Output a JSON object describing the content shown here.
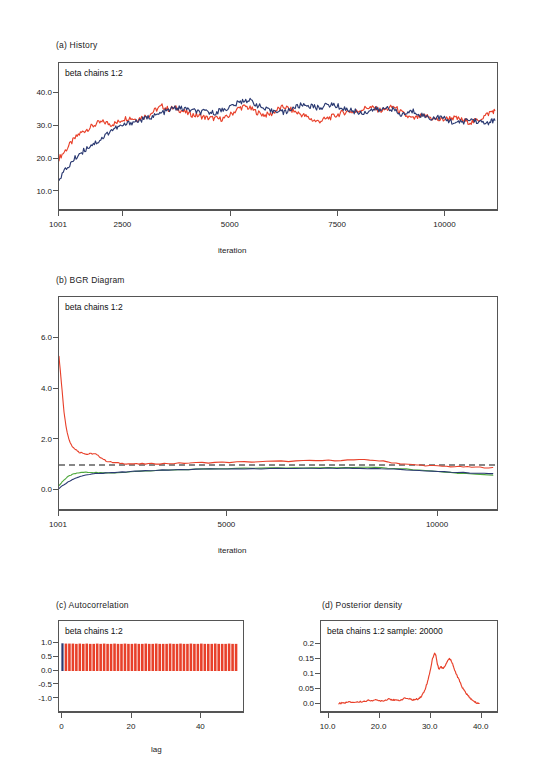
{
  "figure": {
    "panels": [
      {
        "id": "a",
        "title": "(a)  History",
        "legend": "beta chains 1:2",
        "xlabel": "iteration"
      },
      {
        "id": "b",
        "title": "(b)  BGR Diagram",
        "legend": "beta chains 1:2",
        "xlabel": "iteration"
      },
      {
        "id": "c",
        "title": "(c)  Autocorrelation",
        "legend": "beta chains 1:2",
        "xlabel": "lag"
      },
      {
        "id": "d",
        "title": "(d)  Posterior density",
        "legend": "beta chains 1:2 sample: 20000",
        "xlabel": ""
      }
    ]
  },
  "colors": {
    "chain1": "#E8402A",
    "chain2": "#2B3A72",
    "green": "#4FA83D",
    "dashed": "#111111",
    "axis": "#555555"
  },
  "chart_data": [
    {
      "type": "line",
      "panel": "a",
      "title": "(a)  History",
      "legend_text": "beta chains 1:2",
      "xlabel": "iteration",
      "ylabel": "",
      "xticks": [
        "1001",
        "2500",
        "5000",
        "7500",
        "10000"
      ],
      "xtick_values": [
        1001,
        2500,
        5000,
        7500,
        10000
      ],
      "yticks": [
        "10.0",
        "20.0",
        "30.0",
        "40.0"
      ],
      "ytick_values": [
        10,
        20,
        30,
        40
      ],
      "xlim": [
        1001,
        11200
      ],
      "ylim": [
        6,
        45
      ],
      "grid": false,
      "series": [
        {
          "name": "chain 1",
          "color": "#E8402A",
          "x": [
            1001,
            1150,
            1300,
            1450,
            1600,
            1750,
            1900,
            2050,
            2200,
            2350,
            2500,
            2650,
            2800,
            2950,
            3100,
            3250,
            3400,
            3550,
            3700,
            3850,
            4000,
            4150,
            4300,
            4450,
            4600,
            4750,
            4900,
            5050,
            5200,
            5350,
            5500,
            5650,
            5800,
            5950,
            6100,
            6250,
            6400,
            6550,
            6700,
            6850,
            7000,
            7150,
            7300,
            7450,
            7600,
            7750,
            7900,
            8050,
            8200,
            8350,
            8500,
            8650,
            8800,
            8950,
            9100,
            9250,
            9400,
            9550,
            9700,
            9850,
            10000,
            10150,
            10300,
            10450,
            10600,
            10750,
            10900,
            11050,
            11150
          ],
          "values": [
            20.3,
            22.6,
            25.2,
            27.4,
            28.7,
            29.8,
            30.9,
            31.3,
            30.6,
            31.0,
            32.3,
            32.6,
            32.1,
            32.8,
            33.4,
            35.0,
            36.1,
            35.2,
            35.6,
            34.8,
            33.9,
            33.4,
            33.1,
            32.5,
            32.4,
            32.2,
            32.6,
            34.1,
            35.6,
            36.0,
            35.1,
            34.0,
            33.4,
            33.8,
            35.2,
            35.9,
            35.0,
            34.1,
            33.3,
            32.3,
            31.4,
            31.9,
            32.6,
            33.3,
            34.1,
            34.6,
            34.3,
            35.1,
            35.8,
            35.4,
            34.8,
            35.3,
            36.0,
            34.4,
            33.0,
            32.2,
            32.9,
            33.1,
            32.4,
            31.9,
            32.2,
            32.6,
            32.2,
            31.6,
            31.2,
            31.8,
            33.0,
            34.3,
            34.8
          ]
        },
        {
          "name": "chain 2",
          "color": "#2B3A72",
          "x": [
            1001,
            1150,
            1300,
            1450,
            1600,
            1750,
            1900,
            2050,
            2200,
            2350,
            2500,
            2650,
            2800,
            2950,
            3100,
            3250,
            3400,
            3550,
            3700,
            3850,
            4000,
            4150,
            4300,
            4450,
            4600,
            4750,
            4900,
            5050,
            5200,
            5350,
            5500,
            5650,
            5800,
            5950,
            6100,
            6250,
            6400,
            6550,
            6700,
            6850,
            7000,
            7150,
            7300,
            7450,
            7600,
            7750,
            7900,
            8050,
            8200,
            8350,
            8500,
            8650,
            8800,
            8950,
            9100,
            9250,
            9400,
            9550,
            9700,
            9850,
            10000,
            10150,
            10300,
            10450,
            10600,
            10750,
            10900,
            11050,
            11150
          ],
          "values": [
            14.2,
            16.6,
            19.1,
            21.3,
            22.8,
            24.4,
            25.3,
            26.8,
            28.7,
            29.6,
            30.2,
            31.1,
            31.5,
            32.0,
            32.8,
            33.2,
            34.1,
            34.8,
            35.6,
            35.4,
            35.1,
            34.6,
            34.2,
            34.4,
            34.0,
            34.8,
            35.4,
            36.3,
            37.2,
            38.1,
            37.5,
            36.2,
            35.1,
            34.5,
            35.0,
            34.1,
            35.3,
            36.0,
            36.6,
            36.2,
            35.6,
            36.0,
            36.6,
            36.3,
            35.5,
            35.0,
            34.5,
            34.0,
            34.6,
            35.2,
            34.8,
            35.9,
            34.9,
            33.4,
            34.0,
            34.6,
            33.7,
            32.9,
            32.4,
            32.8,
            32.1,
            31.4,
            30.9,
            31.6,
            32.1,
            31.5,
            30.8,
            31.4,
            31.8
          ]
        }
      ]
    },
    {
      "type": "line",
      "panel": "b",
      "title": "(b)  BGR Diagram",
      "legend_text": "beta chains 1:2",
      "xlabel": "iteration",
      "ylabel": "",
      "xticks": [
        "1001",
        "5000",
        "10000"
      ],
      "xtick_values": [
        1001,
        5000,
        10000
      ],
      "yticks": [
        "0.0",
        "2.0",
        "4.0",
        "6.0"
      ],
      "ytick_values": [
        0,
        2,
        4,
        6
      ],
      "xlim": [
        1001,
        11400
      ],
      "ylim": [
        -0.5,
        7.0
      ],
      "grid": false,
      "reference_line": {
        "value": 1.0,
        "style": "dashed",
        "color": "#111111"
      },
      "series": [
        {
          "name": "R-hat",
          "color": "#E8402A",
          "x": [
            1001,
            1060,
            1120,
            1180,
            1250,
            1320,
            1400,
            1480,
            1570,
            1660,
            1760,
            1870,
            1990,
            2120,
            2270,
            2450,
            2650,
            2900,
            3200,
            3600,
            4100,
            4700,
            5400,
            6100,
            6800,
            7400,
            8000,
            8500,
            8900,
            9300,
            9700,
            10100,
            10500,
            10900,
            11300
          ],
          "values": [
            5.3,
            4.2,
            3.1,
            2.4,
            1.95,
            1.72,
            1.62,
            1.5,
            1.48,
            1.42,
            1.45,
            1.43,
            1.3,
            1.16,
            1.1,
            1.07,
            1.05,
            1.04,
            1.05,
            1.06,
            1.08,
            1.1,
            1.12,
            1.14,
            1.16,
            1.18,
            1.2,
            1.19,
            1.1,
            1.02,
            0.98,
            0.95,
            0.93,
            0.91,
            0.9
          ]
        },
        {
          "name": "within-chain",
          "color": "#4FA83D",
          "x": [
            1001,
            1100,
            1220,
            1350,
            1500,
            1680,
            1880,
            2100,
            2400,
            2800,
            3300,
            3900,
            4600,
            5400,
            6200,
            7000,
            7800,
            8500,
            9100,
            9700,
            10300,
            10900,
            11300
          ],
          "values": [
            0.18,
            0.38,
            0.55,
            0.65,
            0.7,
            0.72,
            0.7,
            0.68,
            0.7,
            0.74,
            0.78,
            0.82,
            0.85,
            0.87,
            0.88,
            0.89,
            0.9,
            0.9,
            0.86,
            0.78,
            0.7,
            0.63,
            0.6
          ]
        },
        {
          "name": "pooled",
          "color": "#2B3A72",
          "x": [
            1001,
            1100,
            1220,
            1350,
            1500,
            1680,
            1880,
            2100,
            2400,
            2800,
            3300,
            3900,
            4600,
            5400,
            6200,
            7000,
            7800,
            8500,
            9100,
            9700,
            10300,
            10900,
            11300
          ],
          "values": [
            0.08,
            0.2,
            0.33,
            0.45,
            0.55,
            0.62,
            0.66,
            0.68,
            0.71,
            0.75,
            0.79,
            0.82,
            0.84,
            0.85,
            0.86,
            0.87,
            0.87,
            0.86,
            0.82,
            0.77,
            0.72,
            0.68,
            0.66
          ]
        }
      ]
    },
    {
      "type": "bar",
      "panel": "c",
      "title": "(c)  Autocorrelation",
      "legend_text": "beta chains 1:2",
      "xlabel": "lag",
      "ylabel": "",
      "xticks": [
        "0",
        "20",
        "40"
      ],
      "xtick_values": [
        0,
        20,
        40
      ],
      "yticks": [
        "-1.0",
        "-0.5",
        "0.0",
        "0.5",
        "1.0"
      ],
      "ytick_values": [
        -1.0,
        -0.5,
        0.0,
        0.5,
        1.0
      ],
      "xlim": [
        -1,
        52
      ],
      "ylim": [
        -1.3,
        1.3
      ],
      "grid": false,
      "note": "All lags show autocorrelation near 1.0",
      "series": [
        {
          "name": "chain 1",
          "color": "#E8402A",
          "lags": [
            1,
            2,
            3,
            4,
            5,
            6,
            7,
            8,
            9,
            10,
            11,
            12,
            13,
            14,
            15,
            16,
            17,
            18,
            19,
            20,
            21,
            22,
            23,
            24,
            25,
            26,
            27,
            28,
            29,
            30,
            31,
            32,
            33,
            34,
            35,
            36,
            37,
            38,
            39,
            40,
            41,
            42,
            43,
            44,
            45,
            46,
            47,
            48,
            49,
            50
          ],
          "values": [
            0.99,
            0.99,
            0.99,
            0.98,
            0.99,
            0.98,
            0.99,
            0.98,
            0.98,
            0.99,
            0.98,
            0.99,
            0.98,
            0.98,
            0.99,
            0.98,
            0.98,
            0.99,
            0.98,
            0.98,
            0.99,
            0.98,
            0.98,
            0.99,
            0.98,
            0.98,
            0.99,
            0.98,
            0.98,
            0.98,
            0.99,
            0.98,
            0.98,
            0.99,
            0.98,
            0.98,
            0.99,
            0.98,
            0.98,
            0.99,
            0.98,
            0.98,
            0.98,
            0.99,
            0.98,
            0.98,
            0.98,
            0.99,
            0.98,
            0.98
          ]
        },
        {
          "name": "chain 2",
          "color": "#2B3A72",
          "lags": [
            0
          ],
          "values": [
            1.0
          ]
        }
      ]
    },
    {
      "type": "line",
      "panel": "d",
      "title": "(d)  Posterior density",
      "legend_text": "beta chains 1:2 sample: 20000",
      "xlabel": "",
      "ylabel": "",
      "xticks": [
        "10.0",
        "20.0",
        "30.0",
        "40.0"
      ],
      "xtick_values": [
        10,
        20,
        30,
        40
      ],
      "yticks": [
        "0.0",
        "0.05",
        "0.1",
        "0.15",
        "0.2"
      ],
      "ytick_values": [
        0.0,
        0.05,
        0.1,
        0.15,
        0.2
      ],
      "xlim": [
        8.5,
        43
      ],
      "ylim": [
        -0.01,
        0.225
      ],
      "grid": false,
      "series": [
        {
          "name": "beta density",
          "color": "#E8402A",
          "x": [
            12.0,
            13.0,
            14.0,
            15.0,
            16.0,
            17.0,
            18.0,
            19.0,
            20.0,
            21.0,
            21.8,
            22.4,
            23.0,
            24.0,
            25.0,
            25.8,
            26.4,
            27.0,
            27.6,
            28.2,
            28.8,
            29.4,
            30.0,
            30.4,
            30.8,
            31.0,
            31.3,
            31.6,
            32.0,
            32.4,
            32.8,
            33.2,
            33.6,
            34.0,
            34.4,
            34.8,
            35.2,
            35.6,
            36.0,
            36.4,
            36.8,
            37.2,
            37.6,
            38.0,
            38.5,
            39.0,
            39.5
          ],
          "values": [
            0.002,
            0.004,
            0.006,
            0.006,
            0.007,
            0.009,
            0.012,
            0.013,
            0.011,
            0.012,
            0.018,
            0.015,
            0.012,
            0.013,
            0.02,
            0.017,
            0.014,
            0.015,
            0.018,
            0.026,
            0.045,
            0.075,
            0.12,
            0.155,
            0.17,
            0.165,
            0.135,
            0.118,
            0.125,
            0.12,
            0.128,
            0.142,
            0.152,
            0.148,
            0.13,
            0.108,
            0.094,
            0.08,
            0.062,
            0.05,
            0.04,
            0.03,
            0.022,
            0.015,
            0.008,
            0.004,
            0.002
          ]
        }
      ]
    }
  ]
}
